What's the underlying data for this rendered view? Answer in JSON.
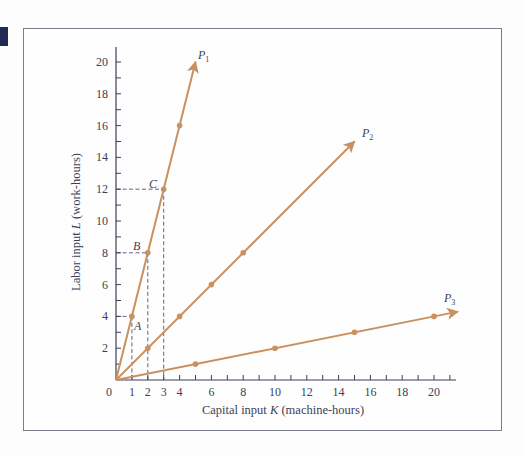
{
  "chart_data": {
    "type": "line",
    "title": "",
    "xlabel": "Capital input K (machine-hours)",
    "ylabel": "Labor input L (work-hours)",
    "xlim": [
      0,
      21
    ],
    "ylim": [
      0,
      21
    ],
    "x_ticks": [
      0,
      1,
      2,
      3,
      4,
      6,
      8,
      10,
      12,
      14,
      16,
      18,
      20
    ],
    "y_ticks": [
      2,
      4,
      6,
      8,
      10,
      12,
      14,
      16,
      18,
      20
    ],
    "grid": false,
    "legend": "none (rays labeled at arrow tips)",
    "series": [
      {
        "name": "P1",
        "points": [
          [
            0,
            0
          ],
          [
            1,
            4
          ],
          [
            2,
            8
          ],
          [
            3,
            12
          ],
          [
            4,
            16
          ]
        ],
        "arrow_to": [
          5,
          20
        ]
      },
      {
        "name": "P2",
        "points": [
          [
            0,
            0
          ],
          [
            2,
            2
          ],
          [
            4,
            4
          ],
          [
            6,
            6
          ],
          [
            8,
            8
          ]
        ],
        "arrow_to": [
          15,
          15
        ]
      },
      {
        "name": "P3",
        "points": [
          [
            0,
            0
          ],
          [
            5,
            1
          ],
          [
            10,
            2
          ],
          [
            15,
            3
          ],
          [
            20,
            4
          ]
        ],
        "arrow_to": [
          21.5,
          4.3
        ]
      }
    ],
    "annotations": [
      {
        "label": "A",
        "x": 1,
        "y": 4
      },
      {
        "label": "B",
        "x": 2,
        "y": 8
      },
      {
        "label": "C",
        "x": 3,
        "y": 12
      }
    ],
    "colors": {
      "rays": "#c99060",
      "axes": "#3b3f58",
      "dashes": "#4b5270"
    }
  },
  "labels": {
    "xaxis": "Capital input K (machine-hours)",
    "xaxis_pre": "Capital input ",
    "xaxis_var": "K",
    "xaxis_post": " (machine-hours)",
    "yaxis_pre": "Labor input ",
    "yaxis_var": "L",
    "yaxis_post": " (work-hours)",
    "origin": "0",
    "p1": "P",
    "p1_sub": "1",
    "p2": "P",
    "p2_sub": "2",
    "p3": "P",
    "p3_sub": "3",
    "a": "A",
    "b": "B",
    "c": "C"
  }
}
